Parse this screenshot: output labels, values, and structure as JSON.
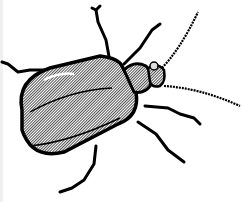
{
  "image": {
    "subject": "beetle",
    "style": "black and white clip-art line drawing with halftone shading",
    "width": 242,
    "height": 202
  },
  "colors": {
    "background": "#ffffff",
    "outline": "#000000",
    "shade": "#9a9a9a",
    "highlight": "#e6e6e6"
  },
  "caption": ""
}
